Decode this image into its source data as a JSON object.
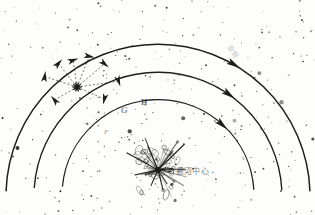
{
  "figure": {
    "kind": "galaxy-spiral-arm-diagram",
    "background_color": "#fdfdfc",
    "ink_color": "#1d1d1b",
    "width": 315,
    "height": 215
  },
  "labels": {
    "galactic_center": "銀河中心",
    "arm_annotation": "旋臂",
    "point_g": "G",
    "point_h": "H",
    "point_f": "F"
  },
  "chart_data": {
    "type": "scatter",
    "title": "銀河中心",
    "xlabel": "",
    "ylabel": "",
    "arcs": [
      {
        "name": "outer-arm",
        "cx": 158,
        "cy": 196,
        "r": 152,
        "start_deg": 182,
        "end_deg": 358,
        "arrow_deg": 300
      },
      {
        "name": "middle-arm",
        "cx": 158,
        "cy": 196,
        "r": 124,
        "start_deg": 184,
        "end_deg": 357,
        "arrow_deg": 305
      },
      {
        "name": "inner-arm",
        "cx": 158,
        "cy": 196,
        "r": 96,
        "start_deg": 186,
        "end_deg": 356,
        "arrow_deg": 312
      }
    ],
    "hub": {
      "name": "sun-node",
      "x": 77,
      "y": 87,
      "spokes": 8
    },
    "burst": {
      "name": "galactic-center-burst",
      "x": 158,
      "y": 170,
      "rays": 34
    },
    "star_count": 430,
    "legend_position": "none",
    "grid": false
  }
}
